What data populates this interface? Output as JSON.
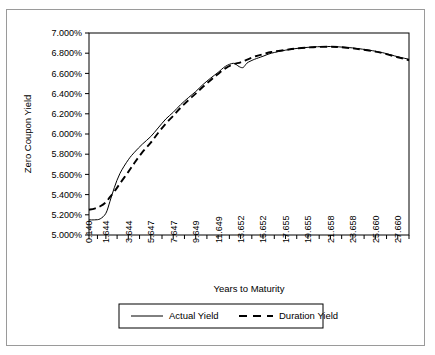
{
  "chart_data": {
    "type": "line",
    "title": "",
    "xlabel": "Years to Maturity",
    "ylabel": "Zero Coupon Yield",
    "xlim": [
      0.14,
      28.66
    ],
    "ylim": [
      5.0,
      7.0
    ],
    "ytick_step": 0.2,
    "grid": false,
    "legend_position": "bottom",
    "ytick_labels": [
      "5.000%",
      "5.200%",
      "5.400%",
      "5.600%",
      "5.800%",
      "6.000%",
      "6.200%",
      "6.400%",
      "6.600%",
      "6.800%",
      "7.000%"
    ],
    "ytick_values": [
      5.0,
      5.2,
      5.4,
      5.6,
      5.8,
      6.0,
      6.2,
      6.4,
      6.6,
      6.8,
      7.0
    ],
    "xtick_labels": [
      "0.140",
      "1.644",
      "3.644",
      "5.647",
      "7.647",
      "9.649",
      "11.649",
      "13.652",
      "15.652",
      "17.655",
      "19.655",
      "21.658",
      "23.658",
      "25.660",
      "27.660"
    ],
    "xtick_values": [
      0.14,
      1.644,
      3.644,
      5.647,
      7.647,
      9.649,
      11.649,
      13.652,
      15.652,
      17.655,
      19.655,
      21.658,
      23.658,
      25.66,
      27.66
    ],
    "minor_xticks_between_labels": 1,
    "series": [
      {
        "name": "Actual Yield",
        "style": "solid",
        "color": "#000000",
        "x": [
          0.14,
          0.64,
          1.14,
          1.644,
          2.0,
          2.4,
          2.9,
          3.644,
          4.2,
          4.9,
          5.647,
          6.3,
          7.0,
          7.647,
          8.3,
          9.0,
          9.649,
          10.3,
          11.0,
          11.649,
          12.3,
          13.0,
          13.4,
          13.652,
          13.9,
          14.2,
          14.5,
          14.9,
          15.652,
          16.4,
          17.655,
          18.5,
          19.655,
          20.5,
          21.658,
          22.5,
          23.658,
          24.5,
          25.66,
          26.5,
          27.66,
          28.66
        ],
        "values": [
          5.15,
          5.15,
          5.16,
          5.215,
          5.33,
          5.47,
          5.61,
          5.745,
          5.82,
          5.9,
          5.975,
          6.06,
          6.15,
          6.215,
          6.29,
          6.36,
          6.42,
          6.49,
          6.555,
          6.61,
          6.67,
          6.7,
          6.676,
          6.66,
          6.66,
          6.7,
          6.72,
          6.74,
          6.77,
          6.8,
          6.83,
          6.845,
          6.858,
          6.864,
          6.866,
          6.862,
          6.852,
          6.84,
          6.82,
          6.8,
          6.765,
          6.74
        ]
      },
      {
        "name": "Duration Yield",
        "style": "dashed",
        "color": "#000000",
        "x": [
          0.14,
          0.64,
          1.14,
          1.644,
          2.0,
          2.4,
          2.9,
          3.644,
          4.2,
          4.9,
          5.647,
          6.3,
          7.0,
          7.647,
          8.3,
          9.0,
          9.649,
          10.3,
          11.0,
          11.649,
          12.3,
          13.0,
          13.652,
          14.3,
          15.0,
          15.652,
          16.4,
          17.655,
          18.5,
          19.655,
          20.5,
          21.658,
          22.5,
          23.658,
          24.5,
          25.66,
          26.5,
          27.66,
          28.66
        ],
        "values": [
          5.25,
          5.262,
          5.285,
          5.325,
          5.375,
          5.43,
          5.51,
          5.625,
          5.715,
          5.82,
          5.915,
          6.01,
          6.105,
          6.18,
          6.26,
          6.335,
          6.4,
          6.468,
          6.535,
          6.595,
          6.65,
          6.69,
          6.71,
          6.74,
          6.77,
          6.79,
          6.812,
          6.832,
          6.845,
          6.856,
          6.862,
          6.864,
          6.86,
          6.848,
          6.836,
          6.816,
          6.795,
          6.76,
          6.73
        ]
      }
    ]
  },
  "legend": {
    "items": [
      {
        "label": "Actual Yield",
        "style": "solid"
      },
      {
        "label": "Duration Yield",
        "style": "dashed"
      }
    ]
  }
}
